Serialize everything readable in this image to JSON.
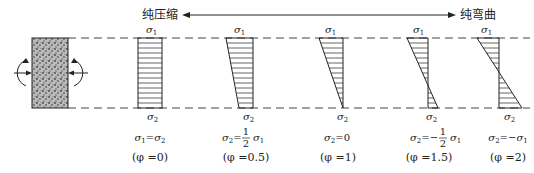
{
  "title_left": "纯压缩",
  "title_right": "纯弯曲",
  "colors": {
    "line": "#222222",
    "dash": "#444444",
    "fill_texture": "#666666"
  },
  "diagrams": [
    {
      "top_label": "σ1",
      "bottom_label": "σ2",
      "relation": "σ1=σ2",
      "phi": "(φ =0)"
    },
    {
      "top_label": "σ1",
      "bottom_label": "σ2",
      "relation": "σ2= 1/2 σ1",
      "phi": "(φ =0.5)"
    },
    {
      "top_label": "σ1",
      "bottom_label": "σ2",
      "relation": "σ2=0",
      "phi": "(φ =1)"
    },
    {
      "top_label": "σ1",
      "bottom_label": "σ2",
      "relation": "σ2=− 1/2 σ1",
      "phi": "(φ =1.5)"
    },
    {
      "top_label": "σ1",
      "bottom_label": "σ2",
      "relation": "σ2=−σ1",
      "phi": "(φ =2)"
    }
  ]
}
